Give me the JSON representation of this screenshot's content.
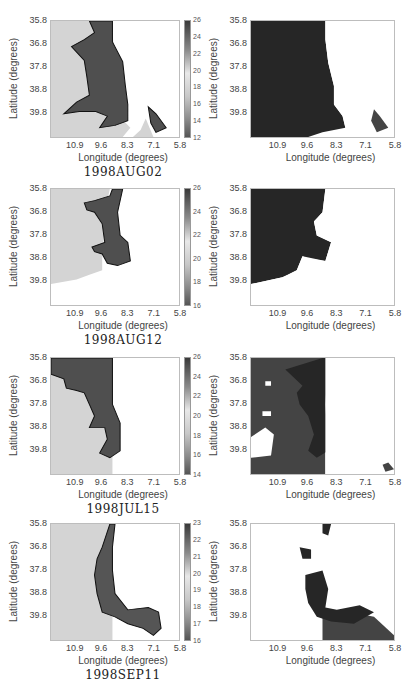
{
  "chart_data": [
    {
      "type": "heatmap",
      "title": "1998AUG02",
      "panel": "left",
      "xlabel": "Longitude (degrees)",
      "ylabel": "Latitude (degrees)",
      "x_ticks": [
        "10.9",
        "9.6",
        "8.3",
        "7.1",
        "5.8"
      ],
      "y_ticks": [
        "35.8",
        "36.8",
        "37.8",
        "38.8",
        "39.8"
      ],
      "colorbar": {
        "ticks": [
          "26",
          "24",
          "22",
          "20",
          "18",
          "16",
          "14",
          "12"
        ],
        "range": [
          12,
          26
        ]
      },
      "description": "SST field with contoured dark warm region along eastern coast"
    },
    {
      "type": "heatmap",
      "panel": "right",
      "xlabel": "Longitude (degrees)",
      "ylabel": "Latitude (degrees)",
      "x_ticks": [
        "10.9",
        "9.6",
        "8.3",
        "7.1",
        "5.8"
      ],
      "y_ticks": [
        "35.8",
        "36.8",
        "37.8",
        "38.8",
        "39.8"
      ],
      "description": "Segmentation map (2 classes) for 1998AUG02"
    },
    {
      "type": "heatmap",
      "title": "1998AUG12",
      "panel": "left",
      "xlabel": "Longitude (degrees)",
      "ylabel": "Latitude (degrees)",
      "x_ticks": [
        "10.9",
        "9.6",
        "8.3",
        "7.1",
        "5.8"
      ],
      "y_ticks": [
        "35.8",
        "36.8",
        "37.8",
        "38.8",
        "39.8"
      ],
      "colorbar": {
        "ticks": [
          "26",
          "24",
          "22",
          "20",
          "18",
          "16"
        ],
        "range": [
          15,
          26
        ]
      }
    },
    {
      "type": "heatmap",
      "panel": "right",
      "xlabel": "Longitude (degrees)",
      "ylabel": "Latitude (degrees)",
      "x_ticks": [
        "10.9",
        "9.6",
        "8.3",
        "7.1",
        "5.8"
      ],
      "y_ticks": [
        "35.8",
        "36.8",
        "37.8",
        "38.8",
        "39.8"
      ],
      "description": "Segmentation map for 1998AUG12"
    },
    {
      "type": "heatmap",
      "title": "1998JUL15",
      "panel": "left",
      "xlabel": "Longitude (degrees)",
      "ylabel": "Latitude (degrees)",
      "x_ticks": [
        "10.9",
        "9.6",
        "8.3",
        "7.1",
        "5.8"
      ],
      "y_ticks": [
        "35.8",
        "36.8",
        "37.8",
        "38.8",
        "39.8"
      ],
      "colorbar": {
        "ticks": [
          "26",
          "24",
          "22",
          "20",
          "18",
          "16",
          "14"
        ],
        "range": [
          14,
          26
        ]
      }
    },
    {
      "type": "heatmap",
      "panel": "right",
      "xlabel": "Longitude (degrees)",
      "ylabel": "Latitude (degrees)",
      "x_ticks": [
        "10.9",
        "9.6",
        "8.3",
        "7.1",
        "5.8"
      ],
      "y_ticks": [
        "35.8",
        "36.8",
        "37.8",
        "38.8",
        "39.8"
      ],
      "description": "Segmentation map for 1998JUL15"
    },
    {
      "type": "heatmap",
      "title": "1998SEP11",
      "panel": "left",
      "xlabel": "Longitude (degrees)",
      "ylabel": "Latitude (degrees)",
      "x_ticks": [
        "10.9",
        "9.6",
        "8.3",
        "7.1",
        "5.8"
      ],
      "y_ticks": [
        "35.8",
        "36.8",
        "37.8",
        "38.8",
        "39.8"
      ],
      "colorbar": {
        "ticks": [
          "23",
          "22",
          "21",
          "20",
          "19",
          "18",
          "17",
          "16"
        ],
        "range": [
          15.5,
          23
        ]
      }
    },
    {
      "type": "heatmap",
      "panel": "right",
      "xlabel": "Longitude (degrees)",
      "ylabel": "Latitude (degrees)",
      "x_ticks": [
        "10.9",
        "9.6",
        "8.3",
        "7.1",
        "5.8"
      ],
      "y_ticks": [
        "35.8",
        "36.8",
        "37.8",
        "38.8",
        "39.8"
      ],
      "description": "Segmentation map for 1998SEP11"
    }
  ],
  "labels": {
    "xlabel": "Longitude (degrees)",
    "ylabel": "Latitude (degrees)",
    "x_ticks": [
      "10.9",
      "9.6",
      "8.3",
      "7.1",
      "5.8"
    ],
    "y_ticks": [
      "35.8",
      "36.8",
      "37.8",
      "38.8",
      "39.8"
    ]
  },
  "rows": [
    {
      "title": "1998AUG02",
      "cbar": [
        "26",
        "24",
        "22",
        "20",
        "18",
        "16",
        "14",
        "12"
      ]
    },
    {
      "title": "1998AUG12",
      "cbar": [
        "26",
        "24",
        "22",
        "20",
        "18",
        "16"
      ]
    },
    {
      "title": "1998JUL15",
      "cbar": [
        "26",
        "24",
        "22",
        "20",
        "18",
        "16",
        "14"
      ]
    },
    {
      "title": "1998SEP11",
      "cbar": [
        "23",
        "22",
        "21",
        "20",
        "19",
        "18",
        "17",
        "16"
      ]
    }
  ],
  "colors": {
    "warm_region": "#4a4a4a",
    "dark_class": "#262626",
    "mid_class": "#444444",
    "cool_water": "#d4d4d4",
    "land_background": "#ffffff"
  }
}
